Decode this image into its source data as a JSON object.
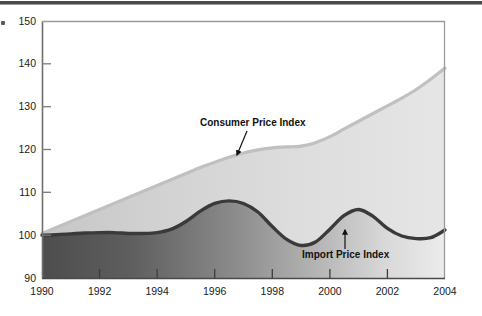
{
  "chart_data": {
    "type": "area",
    "title": "",
    "subtitle": "",
    "xlabel": "",
    "ylabel": "",
    "xlim": [
      1990,
      2004
    ],
    "ylim": [
      90,
      150
    ],
    "grid": false,
    "legend_position": "inline-annotations",
    "x_tick_labels": [
      "1990",
      "1992",
      "1994",
      "1996",
      "1998",
      "2000",
      "2002",
      "2004"
    ],
    "x_ticks": [
      1990,
      1992,
      1994,
      1996,
      1998,
      2000,
      2002,
      2004
    ],
    "y_tick_labels": [
      "150",
      "140",
      "130",
      "120",
      "110",
      "100",
      "90"
    ],
    "y_ticks": [
      150,
      140,
      130,
      120,
      110,
      100,
      90
    ],
    "x": [
      1990,
      1990.5,
      1991,
      1991.5,
      1992,
      1992.5,
      1993,
      1993.5,
      1994,
      1994.5,
      1995,
      1995.5,
      1996,
      1996.5,
      1997,
      1997.5,
      1998,
      1998.5,
      1999,
      1999.5,
      2000,
      2000.5,
      2001,
      2001.5,
      2002,
      2002.5,
      2003,
      2003.5,
      2004
    ],
    "series": [
      {
        "name": "Consumer Price Index",
        "color": "#c9c9c9",
        "style": "area-band-upper",
        "values": [
          100.4,
          101.8,
          103.2,
          104.6,
          106.0,
          107.4,
          108.8,
          110.2,
          111.6,
          113.0,
          114.4,
          115.8,
          117.0,
          118.2,
          119.2,
          119.9,
          120.4,
          120.6,
          120.8,
          121.6,
          123.0,
          124.8,
          126.6,
          128.4,
          130.2,
          132.0,
          134.0,
          136.4,
          139.0
        ]
      },
      {
        "name": "Import Price Index",
        "color": "#3a3a3a",
        "style": "line-dark",
        "values": [
          100.0,
          100.1,
          100.3,
          100.5,
          100.6,
          100.6,
          100.4,
          100.4,
          100.6,
          101.4,
          103.2,
          105.6,
          107.4,
          108.0,
          107.4,
          105.4,
          102.0,
          99.0,
          97.6,
          98.4,
          101.4,
          104.6,
          106.0,
          104.4,
          101.6,
          99.8,
          99.2,
          99.4,
          101.2
        ]
      }
    ],
    "annotations": [
      {
        "text": "Consumer Price Index",
        "label_x": 200,
        "label_y": 126,
        "arrow_from_x": 247,
        "arrow_from_y": 131,
        "arrow_to_x": 237,
        "arrow_to_y": 155
      },
      {
        "text": "Import Price Index",
        "label_x": 302,
        "label_y": 258,
        "arrow_from_x": 345,
        "arrow_from_y": 249,
        "arrow_to_x": 345,
        "arrow_to_y": 230
      }
    ]
  },
  "axis": {
    "y_label_150": "150",
    "y_label_140": "140",
    "y_label_130": "130",
    "y_label_120": "120",
    "y_label_110": "110",
    "y_label_100": "100",
    "y_label_90": "90"
  }
}
